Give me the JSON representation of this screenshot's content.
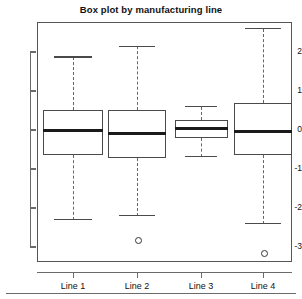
{
  "chart_data": {
    "type": "box",
    "title": "Box plot by manufacturing line",
    "xlabel": "",
    "ylabel": "",
    "categories": [
      "Line 1",
      "Line 2",
      "Line 3",
      "Line 4"
    ],
    "ylim": [
      -3.45,
      2.75
    ],
    "yticks": [
      2,
      1,
      0,
      -1,
      -2,
      -3
    ],
    "ytick_labels": [
      "2",
      "1",
      "0",
      "-1",
      "-2",
      "-3"
    ],
    "grid": false,
    "legend": null,
    "boxes": [
      {
        "category": "Line 1",
        "whisker_low": -2.3,
        "q1": -0.65,
        "median": 0.0,
        "q3": 0.52,
        "whisker_high": 1.87,
        "outliers": []
      },
      {
        "category": "Line 2",
        "whisker_low": -2.2,
        "q1": -0.72,
        "median": -0.1,
        "q3": 0.52,
        "whisker_high": 2.15,
        "outliers": [
          -2.8
        ]
      },
      {
        "category": "Line 3",
        "whisker_low": -0.68,
        "q1": -0.2,
        "median": 0.05,
        "q3": 0.25,
        "whisker_high": 0.6,
        "outliers": []
      },
      {
        "category": "Line 4",
        "whisker_low": -2.4,
        "q1": -0.65,
        "median": -0.03,
        "q3": 0.7,
        "whisker_high": 2.6,
        "outliers": [
          -3.15
        ]
      }
    ]
  },
  "axis": {
    "tick_labels_y": [
      "2",
      "1",
      "0",
      "-1",
      "-2",
      "-3"
    ],
    "tick_labels_x": [
      "Line 1",
      "Line 2",
      "Line 3",
      "Line 4"
    ]
  },
  "colors": {
    "box_stroke": "#4a4a4a",
    "median": "#1a1a1a",
    "whisker": "#666666",
    "frame": "#555555",
    "text": "#111111"
  }
}
